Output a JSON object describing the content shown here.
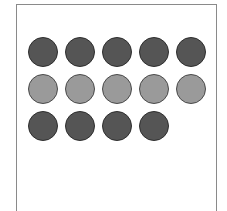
{
  "panel": {
    "rows": [
      {
        "shade": "dark",
        "count": 5,
        "color": "#555555"
      },
      {
        "shade": "light",
        "count": 5,
        "color": "#9a9a9a"
      },
      {
        "shade": "dark",
        "count": 4,
        "color": "#555555"
      }
    ],
    "total_dots": 14
  }
}
